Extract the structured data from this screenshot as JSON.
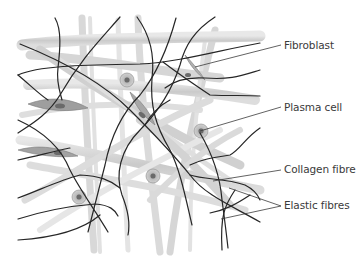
{
  "diagram": {
    "colors": {
      "background": "#ffffff",
      "collagen_fibre": "#c9c9c9",
      "collagen_highlight": "#e6e6e6",
      "elastic_fibre": "#262626",
      "leader_line": "#3a3a3a",
      "label_text": "#3a3a3a",
      "cell_body": "#b8b8b8"
    },
    "labels": [
      {
        "id": "fibroblast",
        "text": "Fibroblast",
        "x": 284,
        "y": 41
      },
      {
        "id": "plasma-cell",
        "text": "Plasma cell",
        "x": 284,
        "y": 102
      },
      {
        "id": "collagen-fibre",
        "text": "Collagen fibre",
        "x": 284,
        "y": 163
      },
      {
        "id": "elastic-fibres",
        "text": "Elastic fibres",
        "x": 284,
        "y": 199
      }
    ]
  }
}
